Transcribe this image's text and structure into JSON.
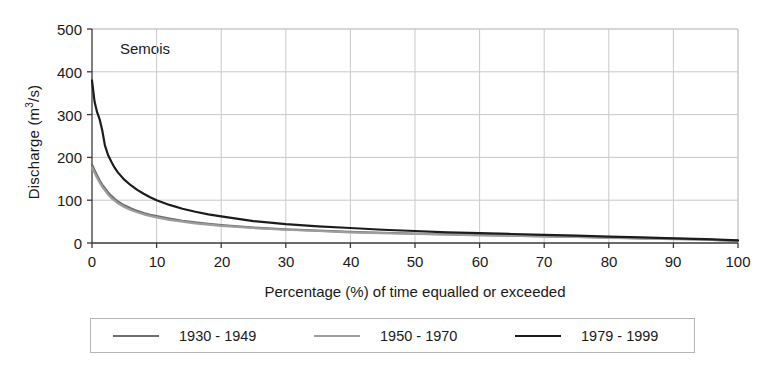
{
  "chart_data": {
    "type": "line",
    "title": "",
    "annotation": "Semois",
    "xlabel": "Percentage (%) of time equalled or exceeded",
    "ylabel": "Discharge (m",
    "ylabel_sup": "3",
    "ylabel_tail": "/s)",
    "ylabel_full": "Discharge (m3/s)",
    "xlim": [
      0,
      100
    ],
    "ylim": [
      0,
      500
    ],
    "xticks": [
      0,
      10,
      20,
      30,
      40,
      50,
      60,
      70,
      80,
      90,
      100
    ],
    "yticks": [
      0,
      100,
      200,
      300,
      400,
      500
    ],
    "grid": true,
    "legend_position": "below",
    "x": [
      0,
      0.4,
      0.8,
      1.2,
      1.6,
      2,
      2.5,
      3,
      3.5,
      4,
      5,
      6,
      7,
      8,
      9,
      10,
      12,
      14,
      16,
      18,
      20,
      25,
      30,
      35,
      40,
      45,
      50,
      55,
      60,
      65,
      70,
      75,
      80,
      85,
      90,
      95,
      100
    ],
    "series": [
      {
        "name": "1930 - 1949",
        "color": "#6e6e6e",
        "width": 2.2,
        "values": [
          183,
          170,
          158,
          146,
          136,
          128,
          118,
          110,
          103,
          97,
          88,
          81,
          75,
          70,
          66,
          63,
          57,
          52,
          48,
          45,
          42,
          36,
          32,
          29,
          26,
          24,
          22,
          20,
          19,
          17,
          16,
          14,
          13,
          11,
          10,
          8,
          5
        ]
      },
      {
        "name": "1950 - 1970",
        "color": "#9d9d9d",
        "width": 2.2,
        "values": [
          176,
          164,
          152,
          141,
          131,
          123,
          113,
          105,
          99,
          93,
          84,
          77,
          72,
          67,
          63,
          60,
          54,
          50,
          46,
          43,
          40,
          35,
          31,
          28,
          25,
          23,
          21,
          20,
          18,
          17,
          15,
          14,
          12,
          11,
          9,
          8,
          5
        ]
      },
      {
        "name": "1979 - 1999",
        "color": "#1c1c1c",
        "width": 2.2,
        "values": [
          380,
          330,
          305,
          288,
          262,
          228,
          205,
          190,
          176,
          165,
          148,
          135,
          124,
          115,
          107,
          100,
          89,
          80,
          73,
          67,
          62,
          51,
          44,
          39,
          35,
          31,
          28,
          25,
          23,
          21,
          19,
          17,
          15,
          13,
          11,
          9,
          6
        ]
      }
    ]
  },
  "axes": {
    "yticks_text": [
      "500",
      "400",
      "300",
      "200",
      "100",
      "0"
    ],
    "xticks_text": [
      "0",
      "10",
      "20",
      "30",
      "40",
      "50",
      "60",
      "70",
      "80",
      "90",
      "100"
    ]
  },
  "colors": {
    "axis": "#3a3a3a",
    "grid": "#c9c9c9",
    "legend_border": "#b5b5b5",
    "series_1": "#6e6e6e",
    "series_2": "#9d9d9d",
    "series_3": "#1c1c1c"
  }
}
